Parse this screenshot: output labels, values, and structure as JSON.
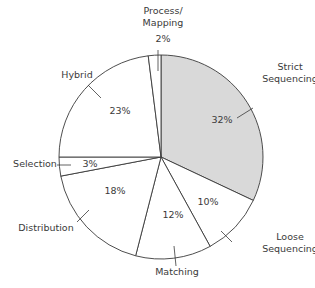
{
  "chart_data": {
    "type": "pie",
    "title": "",
    "start_angle_deg": 0,
    "direction": "clockwise",
    "slices": [
      {
        "name": "Strict Sequencing",
        "label_lines": [
          "Strict",
          "Sequencing"
        ],
        "value": 32,
        "pct_label": "32%",
        "fill": "#d9d9d9"
      },
      {
        "name": "Loose Sequencing",
        "label_lines": [
          "Loose",
          "Sequencing"
        ],
        "value": 10,
        "pct_label": "10%",
        "fill": "#ffffff"
      },
      {
        "name": "Matching",
        "label_lines": [
          "Matching"
        ],
        "value": 12,
        "pct_label": "12%",
        "fill": "#ffffff"
      },
      {
        "name": "Distribution",
        "label_lines": [
          "Distribution"
        ],
        "value": 18,
        "pct_label": "18%",
        "fill": "#ffffff"
      },
      {
        "name": "Selection",
        "label_lines": [
          "Selection"
        ],
        "value": 3,
        "pct_label": "3%",
        "fill": "#ffffff"
      },
      {
        "name": "Hybrid",
        "label_lines": [
          "Hybrid"
        ],
        "value": 23,
        "pct_label": "23%",
        "fill": "#ffffff"
      },
      {
        "name": "Process/Mapping",
        "label_lines": [
          "Process/",
          "Mapping"
        ],
        "value": 2,
        "pct_label": "2%",
        "fill": "#ffffff"
      }
    ],
    "stroke": "#3a3a3a"
  }
}
